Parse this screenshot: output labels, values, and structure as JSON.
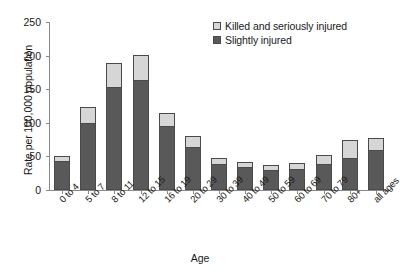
{
  "chart_data": {
    "type": "bar",
    "title": "",
    "subtitle": "",
    "stacked": true,
    "xlabel": "Age",
    "ylabel": "Rate per 100,000 population",
    "ylim": [
      0,
      250
    ],
    "yticks": [
      0,
      50,
      100,
      150,
      200,
      250
    ],
    "grid": false,
    "legend_position": "top-right",
    "categories": [
      "0 to 4",
      "5 to 7",
      "8 to 11",
      "12 to 15",
      "16 to 19",
      "20 to 29",
      "30 to 39",
      "40 to 49",
      "50 to 59",
      "60 to 69",
      "70 to 79",
      "80+",
      "all ages"
    ],
    "series": [
      {
        "name": "Slightly injured",
        "color": "#595959",
        "values": [
          43,
          99,
          153,
          163,
          96,
          64,
          38,
          34,
          30,
          32,
          38,
          47,
          59
        ]
      },
      {
        "name": "Killed and seriously injured",
        "color": "#d6d6d6",
        "values": [
          7,
          25,
          36,
          38,
          19,
          16,
          9,
          7,
          7,
          8,
          14,
          28,
          18
        ]
      }
    ],
    "totals": [
      50,
      124,
      189,
      201,
      115,
      80,
      47,
      41,
      37,
      40,
      52,
      75,
      77
    ]
  },
  "legend": {
    "entries": [
      {
        "label": "Killed and seriously injured",
        "color": "#d6d6d6"
      },
      {
        "label": "Slightly injured",
        "color": "#595959"
      }
    ]
  },
  "colors": {
    "killed_seriously_injured": "#d6d6d6",
    "slightly_injured": "#595959",
    "axis": "#8a8a8a",
    "outline": "#4a4a4a",
    "background": "#ffffff"
  }
}
